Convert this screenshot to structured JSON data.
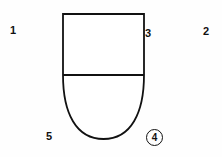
{
  "figure": {
    "background_color": "#fefefe",
    "line_color": "#111111",
    "width": 222,
    "height": 157
  },
  "shape": {
    "name": "bullet-outline",
    "description": "Rectangle with a semi-elliptical rounded bottom, divided by a horizontal line",
    "left": 63,
    "right": 144,
    "top": 14,
    "divider_y": 75,
    "bottom": 139,
    "stroke_width": 1.8
  },
  "labels": [
    {
      "id": "1",
      "text": "1",
      "circled": false,
      "x": 10,
      "y": 25
    },
    {
      "id": "2",
      "text": "2",
      "circled": false,
      "x": 203,
      "y": 26
    },
    {
      "id": "3",
      "text": "3",
      "circled": false,
      "x": 145,
      "y": 28
    },
    {
      "id": "4",
      "text": "4",
      "circled": true,
      "x": 146,
      "y": 129
    },
    {
      "id": "5",
      "text": "5",
      "circled": false,
      "x": 46,
      "y": 131
    }
  ]
}
